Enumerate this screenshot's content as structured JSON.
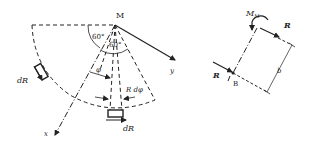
{
  "left_diagram": {
    "point_label": "M",
    "angle_outer": "60°",
    "angle_inner": "60°",
    "angle_phi": "φ",
    "arc_element": "R dφ",
    "force_left": "dR",
    "force_bottom": "dR",
    "axis_x": "x",
    "axis_y": "y"
  },
  "right_diagram": {
    "moment_label": "M",
    "moment_sub": "M",
    "force_top": "R",
    "force_left": "R",
    "point_label": "B",
    "dimension": "b"
  }
}
